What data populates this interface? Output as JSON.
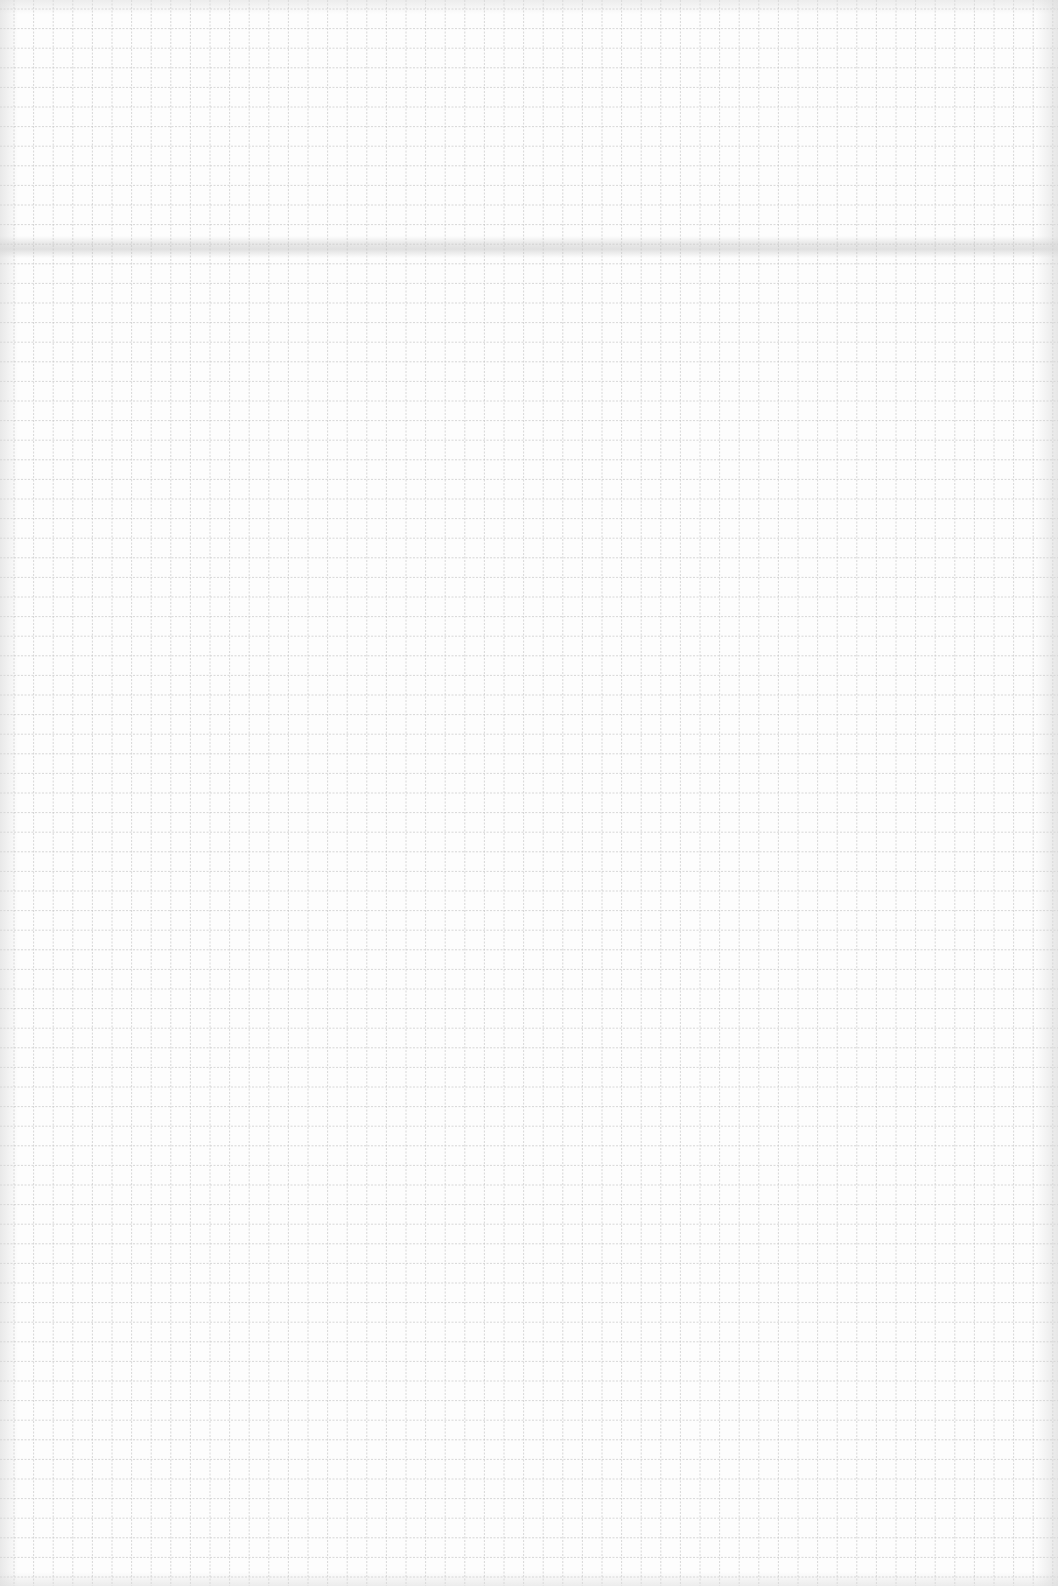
{
  "page": {
    "kind": "blank graph paper",
    "text_content": []
  },
  "colors": {
    "paper": "#fdfdfd",
    "grid_line": "#c4c4c4",
    "fold_shadow": "#bebebe"
  }
}
